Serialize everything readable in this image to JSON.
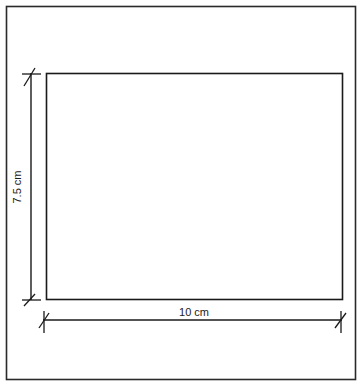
{
  "diagram": {
    "type": "dimensioned-rectangle",
    "shape": "rectangle",
    "width_label": "10 cm",
    "height_label": "7.5 cm",
    "dimensions": {
      "width": {
        "value": 10,
        "unit": "cm"
      },
      "height": {
        "value": 7.5,
        "unit": "cm"
      }
    },
    "colors": {
      "line": "#1a1a1a",
      "frame": "#2a2a2a",
      "background": "#ffffff"
    }
  }
}
